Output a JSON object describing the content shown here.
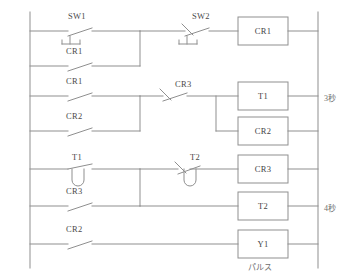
{
  "diagram": {
    "title_fragment": "",
    "type": "ladder-logic",
    "rails": {
      "left": "left-power-rail",
      "right": "right-power-rail"
    },
    "rungs": [
      {
        "index": 1,
        "contacts": [
          "SW1"
        ],
        "coil": "CR1"
      },
      {
        "index": 2,
        "contacts": [
          "CR1"
        ],
        "coil": ""
      },
      {
        "index": 3,
        "contacts": [
          "CR1",
          "CR3"
        ],
        "coil": "T1"
      },
      {
        "index": 4,
        "contacts": [
          "CR2"
        ],
        "coil": "CR2"
      },
      {
        "index": 5,
        "contacts": [
          "T1",
          "T2"
        ],
        "coil": "CR3"
      },
      {
        "index": 6,
        "contacts": [
          "CR3"
        ],
        "coil": "T2"
      },
      {
        "index": 7,
        "contacts": [
          "CR2"
        ],
        "coil": "Y1"
      }
    ],
    "contacts": [
      {
        "id": "sw1",
        "label": "SW1",
        "kind": "no-switch",
        "actuator": "manual"
      },
      {
        "id": "cr1-a",
        "label": "CR1",
        "kind": "no"
      },
      {
        "id": "sw2",
        "label": "SW2",
        "kind": "nc-switch",
        "actuator": "manual"
      },
      {
        "id": "cr1-b",
        "label": "CR1",
        "kind": "no"
      },
      {
        "id": "cr3-nc",
        "label": "CR3",
        "kind": "nc"
      },
      {
        "id": "cr2-a",
        "label": "CR2",
        "kind": "no"
      },
      {
        "id": "t1-no",
        "label": "T1",
        "kind": "no-timer"
      },
      {
        "id": "t2-nc",
        "label": "T2",
        "kind": "nc-timer"
      },
      {
        "id": "cr3-no",
        "label": "CR3",
        "kind": "no"
      },
      {
        "id": "cr2-b",
        "label": "CR2",
        "kind": "no"
      }
    ],
    "coils": [
      {
        "id": "coil-cr1",
        "label": "CR1"
      },
      {
        "id": "coil-t1",
        "label": "T1",
        "note": "3秒"
      },
      {
        "id": "coil-cr2",
        "label": "CR2"
      },
      {
        "id": "coil-cr3",
        "label": "CR3"
      },
      {
        "id": "coil-t2",
        "label": "T2",
        "note": "4秒"
      },
      {
        "id": "coil-y1",
        "label": "Y1",
        "note": "パルス"
      }
    ],
    "annotations": {
      "timer_t1": "3秒",
      "timer_t2": "4秒",
      "output_y1": "パルス"
    },
    "colors": {
      "line": "#8f8f8f",
      "text": "#4a4a4a",
      "note": "#6e6e6e",
      "background": "#ffffff"
    }
  }
}
